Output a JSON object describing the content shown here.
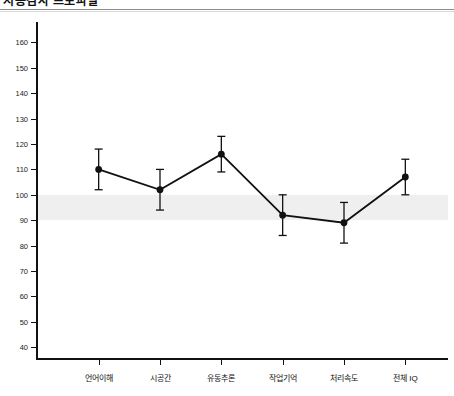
{
  "header": {
    "title": "지능검사 프로파일",
    "title_note": "clipped-at-top"
  },
  "chart_data": {
    "type": "line",
    "title": "지능검사 프로파일",
    "xlabel": "",
    "ylabel": "",
    "ylim": [
      35,
      168
    ],
    "ytick_start": 40,
    "ytick_end": 160,
    "ytick_step": 10,
    "yticks": [
      40,
      50,
      60,
      70,
      80,
      90,
      100,
      110,
      120,
      130,
      140,
      150,
      160
    ],
    "grid": false,
    "legend": "none",
    "marker": "filled-circle",
    "line_color": "#111111",
    "marker_color": "#111111",
    "band_color": "#efefef",
    "categories": [
      "언어이해",
      "시공간",
      "유동추론",
      "작업기억",
      "처리속도",
      "전체 IQ"
    ],
    "values": [
      110,
      102,
      116,
      92,
      89,
      107
    ],
    "errors": [
      8,
      8,
      7,
      8,
      8,
      7
    ],
    "error_low": [
      102,
      94,
      109,
      84,
      81,
      100
    ],
    "error_high": [
      118,
      110,
      123,
      100,
      97,
      114
    ],
    "annotations": [
      {
        "name": "average-band",
        "type": "hband",
        "from": 90,
        "to": 100
      }
    ]
  }
}
